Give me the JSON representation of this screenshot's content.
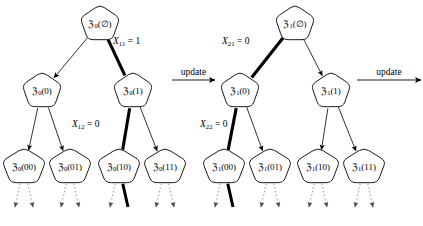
{
  "figure": {
    "type": "diagram",
    "background_color": "#ffffff",
    "line_color": "#000000",
    "highlight_color": "#000000",
    "dotted_color": "#8a8a8a"
  },
  "transitions": [
    {
      "name": "update-arrow-1",
      "label": "update",
      "x1": 172,
      "x2": 215,
      "y": 80
    },
    {
      "name": "update-arrow-2",
      "label": "update",
      "x1": 357,
      "x2": 421,
      "y": 80
    }
  ],
  "trees": [
    {
      "name": "tree-0",
      "nodes": [
        {
          "id": "t0-root",
          "prefix": "ℨ",
          "sub": "0",
          "arg": "(∅)",
          "cx": 100,
          "cy": 24,
          "rx": 20,
          "ry": 19
        },
        {
          "id": "t0-n0",
          "prefix": "ℨ",
          "sub": "0",
          "arg": "(0)",
          "cx": 42,
          "cy": 91,
          "rx": 20,
          "ry": 19
        },
        {
          "id": "t0-n1",
          "prefix": "ℨ",
          "sub": "0",
          "arg": "(1)",
          "cx": 133,
          "cy": 91,
          "rx": 20,
          "ry": 19
        },
        {
          "id": "t0-n00",
          "prefix": "ℨ",
          "sub": "0",
          "arg": "(00)",
          "cx": 24,
          "cy": 167,
          "rx": 22,
          "ry": 19
        },
        {
          "id": "t0-n01",
          "prefix": "ℨ",
          "sub": "0",
          "arg": "(01)",
          "cx": 70,
          "cy": 167,
          "rx": 22,
          "ry": 19
        },
        {
          "id": "t0-n10",
          "prefix": "ℨ",
          "sub": "0",
          "arg": "(10)",
          "cx": 119,
          "cy": 167,
          "rx": 22,
          "ry": 19
        },
        {
          "id": "t0-n11",
          "prefix": "ℨ",
          "sub": "0",
          "arg": "(11)",
          "cx": 165,
          "cy": 167,
          "rx": 22,
          "ry": 19
        }
      ],
      "edge_labels": [
        {
          "name": "edge-label-x11",
          "var": "X",
          "sub": "11",
          "eq": " = ",
          "value": "1",
          "x": 113,
          "y": 44
        },
        {
          "name": "edge-label-x12",
          "var": "X",
          "sub": "12",
          "eq": " = ",
          "value": "0",
          "x": 72,
          "y": 127
        }
      ]
    },
    {
      "name": "tree-1",
      "nodes": [
        {
          "id": "t1-root",
          "prefix": "ℨ",
          "sub": "1",
          "arg": "(∅)",
          "cx": 295,
          "cy": 24,
          "rx": 20,
          "ry": 19
        },
        {
          "id": "t1-n0",
          "prefix": "ℨ",
          "sub": "1",
          "arg": "(0)",
          "cx": 240,
          "cy": 91,
          "rx": 20,
          "ry": 19
        },
        {
          "id": "t1-n1",
          "prefix": "ℨ",
          "sub": "1",
          "arg": "(1)",
          "cx": 331,
          "cy": 91,
          "rx": 20,
          "ry": 19
        },
        {
          "id": "t1-n00",
          "prefix": "ℨ",
          "sub": "1",
          "arg": "(00)",
          "cx": 224,
          "cy": 167,
          "rx": 22,
          "ry": 19
        },
        {
          "id": "t1-n01",
          "prefix": "ℨ",
          "sub": "1",
          "arg": "(01)",
          "cx": 270,
          "cy": 167,
          "rx": 22,
          "ry": 19
        },
        {
          "id": "t1-n10",
          "prefix": "ℨ",
          "sub": "1",
          "arg": "(10)",
          "cx": 318,
          "cy": 167,
          "rx": 22,
          "ry": 19
        },
        {
          "id": "t1-n11",
          "prefix": "ℨ",
          "sub": "1",
          "arg": "(11)",
          "cx": 364,
          "cy": 167,
          "rx": 22,
          "ry": 19
        }
      ],
      "edge_labels": [
        {
          "name": "edge-label-x21",
          "var": "X",
          "sub": "21",
          "eq": " = ",
          "value": "0",
          "x": 222,
          "y": 44
        },
        {
          "name": "edge-label-x22",
          "var": "X",
          "sub": "22",
          "eq": " = ",
          "value": "0",
          "x": 200,
          "y": 127
        }
      ]
    }
  ]
}
